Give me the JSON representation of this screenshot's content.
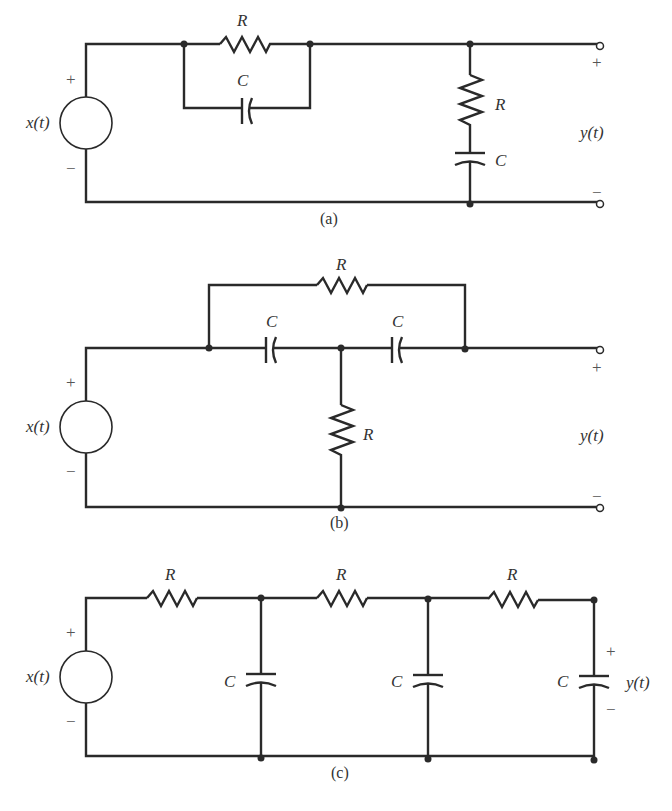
{
  "figure": {
    "panels": [
      {
        "id": "a",
        "caption": "(a)",
        "source_label": "x(t)",
        "output_label": "y(t)",
        "plus": "+",
        "minus": "−",
        "out_plus": "+",
        "out_minus": "−",
        "components": [
          {
            "type": "resistor",
            "label": "R",
            "placement": "series, parallel with C"
          },
          {
            "type": "capacitor",
            "label": "C",
            "placement": "series, parallel with R"
          },
          {
            "type": "resistor",
            "label": "R",
            "placement": "shunt branch"
          },
          {
            "type": "capacitor",
            "label": "C",
            "placement": "shunt branch, in series with R"
          }
        ]
      },
      {
        "id": "b",
        "caption": "(b)",
        "source_label": "x(t)",
        "output_label": "y(t)",
        "plus": "+",
        "minus": "−",
        "out_plus": "+",
        "out_minus": "−",
        "components": [
          {
            "type": "resistor",
            "label": "R",
            "placement": "bridging across both capacitors"
          },
          {
            "type": "capacitor",
            "label": "C",
            "placement": "series 1"
          },
          {
            "type": "capacitor",
            "label": "C",
            "placement": "series 2"
          },
          {
            "type": "resistor",
            "label": "R",
            "placement": "shunt from middle node"
          }
        ]
      },
      {
        "id": "c",
        "caption": "(c)",
        "source_label": "x(t)",
        "output_label": "y(t)",
        "plus": "+",
        "minus": "−",
        "out_plus": "+",
        "out_minus": "−",
        "components": [
          {
            "type": "resistor",
            "label": "R",
            "placement": "stage 1 series"
          },
          {
            "type": "capacitor",
            "label": "C",
            "placement": "stage 1 shunt"
          },
          {
            "type": "resistor",
            "label": "R",
            "placement": "stage 2 series"
          },
          {
            "type": "capacitor",
            "label": "C",
            "placement": "stage 2 shunt"
          },
          {
            "type": "resistor",
            "label": "R",
            "placement": "stage 3 series"
          },
          {
            "type": "capacitor",
            "label": "C",
            "placement": "stage 3 shunt (output)"
          }
        ]
      }
    ]
  }
}
